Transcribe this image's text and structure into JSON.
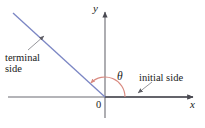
{
  "figure": {
    "type": "angle-standard-position-diagram",
    "width": 205,
    "height": 128,
    "background_color": "#ffffff"
  },
  "axes": {
    "y_label": "y",
    "x_label": "x",
    "origin_label": "0",
    "color": "#6b6b72",
    "x_axis": {
      "from_x": 8,
      "to_x": 197,
      "y": 97
    },
    "y_axis": {
      "x": 105,
      "from_y": 8,
      "to_y": 118
    }
  },
  "angle": {
    "symbol": "θ",
    "arc_color": "#d98a80",
    "arc_radius": 20,
    "start_degrees": 0,
    "end_degrees": 135,
    "direction": "counterclockwise"
  },
  "rays": {
    "terminal": {
      "label_line_1": "terminal",
      "label_line_2": "side",
      "color": "#7b86c4",
      "from_x": 105,
      "from_y": 97,
      "to_x": 13,
      "to_y": 13
    },
    "initial": {
      "label": "initial side",
      "color": "#4a4a52",
      "from_x": 105,
      "from_y": 97,
      "to_x": 197,
      "to_y": 97
    }
  },
  "leaders": {
    "color": "#8a8a90",
    "terminal": {
      "from_x": 28,
      "from_y": 50,
      "to_x": 45,
      "to_y": 35
    },
    "initial": {
      "from_x": 152,
      "from_y": 82,
      "to_x": 137,
      "to_y": 94
    }
  }
}
